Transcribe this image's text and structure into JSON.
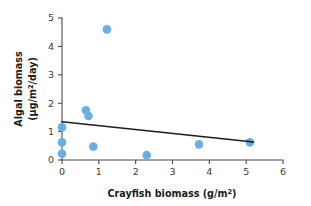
{
  "chart_data": {
    "type": "scatter",
    "title": "",
    "subtitle": "",
    "xlabel": "Crayfish biomass (g/m²)",
    "xlabel_parts": {
      "base": "Crayfish biomass (g/m",
      "sup": "2",
      "tail": ")"
    },
    "ylabel": "Algal biomass (μg/m²/day)",
    "ylabel_line1": "Algal biomass",
    "ylabel_line2_parts": {
      "base": "(μg/m",
      "sup": "2",
      "tail": "/day)"
    },
    "xlim": [
      0,
      6
    ],
    "ylim": [
      0,
      5
    ],
    "xticks": [
      0,
      1,
      2,
      3,
      4,
      5,
      6
    ],
    "xtick_labels": [
      "0",
      "1",
      "2",
      "3",
      "4",
      "5",
      "6"
    ],
    "yticks": [
      0,
      1,
      2,
      3,
      4,
      5
    ],
    "ytick_labels": [
      "0",
      "1",
      "2",
      "3",
      "4",
      "5"
    ],
    "grid": false,
    "legend": false,
    "legend_position": "none",
    "marker_color": "#6DAEE0",
    "marker_size": 6.4,
    "axis_color": "#4a4a4c",
    "points": [
      {
        "x": 0.0,
        "y": 1.15
      },
      {
        "x": 0.0,
        "y": 0.62
      },
      {
        "x": 0.0,
        "y": 0.22
      },
      {
        "x": 0.65,
        "y": 1.75
      },
      {
        "x": 0.72,
        "y": 1.55
      },
      {
        "x": 0.85,
        "y": 0.47
      },
      {
        "x": 1.22,
        "y": 4.6
      },
      {
        "x": 2.3,
        "y": 0.17
      },
      {
        "x": 3.72,
        "y": 0.55
      },
      {
        "x": 5.1,
        "y": 0.62
      }
    ],
    "trendline": {
      "name": "fitted regression line",
      "color": "#1c1c1c",
      "x_start": 0.0,
      "y_start": 1.35,
      "x_end": 5.2,
      "y_end": 0.63,
      "slope": -0.1385,
      "intercept": 1.35
    }
  }
}
